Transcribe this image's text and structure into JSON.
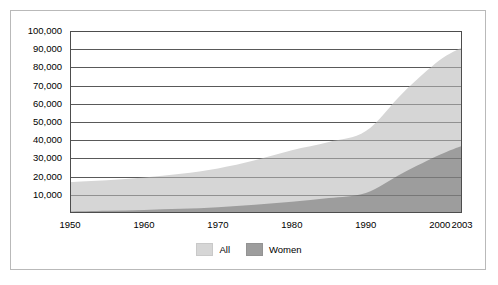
{
  "chart_data": {
    "type": "area",
    "title": "",
    "subtitle": "",
    "xlabel": "",
    "ylabel": "",
    "xlim": [
      1950,
      2003
    ],
    "ylim": [
      0,
      100000
    ],
    "grid": true,
    "legend_position": "bottom-center",
    "x_tick_labels": [
      "1950",
      "1960",
      "1970",
      "1980",
      "1990",
      "2000",
      "2003"
    ],
    "x_tick_values": [
      1950,
      1960,
      1970,
      1980,
      1990,
      2000,
      2003
    ],
    "y_tick_labels": [
      "10,000",
      "20,000",
      "30,000",
      "40,000",
      "50,000",
      "60,000",
      "70,000",
      "80,000",
      "90,000",
      "100,000"
    ],
    "y_tick_values": [
      10000,
      20000,
      30000,
      40000,
      50000,
      60000,
      70000,
      80000,
      90000,
      100000
    ],
    "x": [
      1950,
      1955,
      1960,
      1965,
      1970,
      1975,
      1980,
      1985,
      1990,
      1995,
      2000,
      2003
    ],
    "series": [
      {
        "name": "All",
        "color": "#d6d6d6",
        "values": [
          17000,
          18000,
          19500,
          21500,
          24500,
          29000,
          34500,
          39000,
          45000,
          66000,
          84000,
          91000
        ]
      },
      {
        "name": "Women",
        "color": "#9d9d9d",
        "values": [
          800,
          1200,
          1700,
          2300,
          3200,
          4500,
          6200,
          8200,
          11000,
          22000,
          32000,
          37000
        ]
      }
    ],
    "legend": [
      {
        "label": "All",
        "color": "#d6d6d6"
      },
      {
        "label": "Women",
        "color": "#9d9d9d"
      }
    ]
  },
  "colors": {
    "all_area": "#d6d6d6",
    "women_area": "#9d9d9d",
    "gridline": "#595959",
    "axis": "#4d4d4d",
    "frame_border": "#b9b9b9",
    "background": "#ffffff",
    "text": "#000000"
  }
}
